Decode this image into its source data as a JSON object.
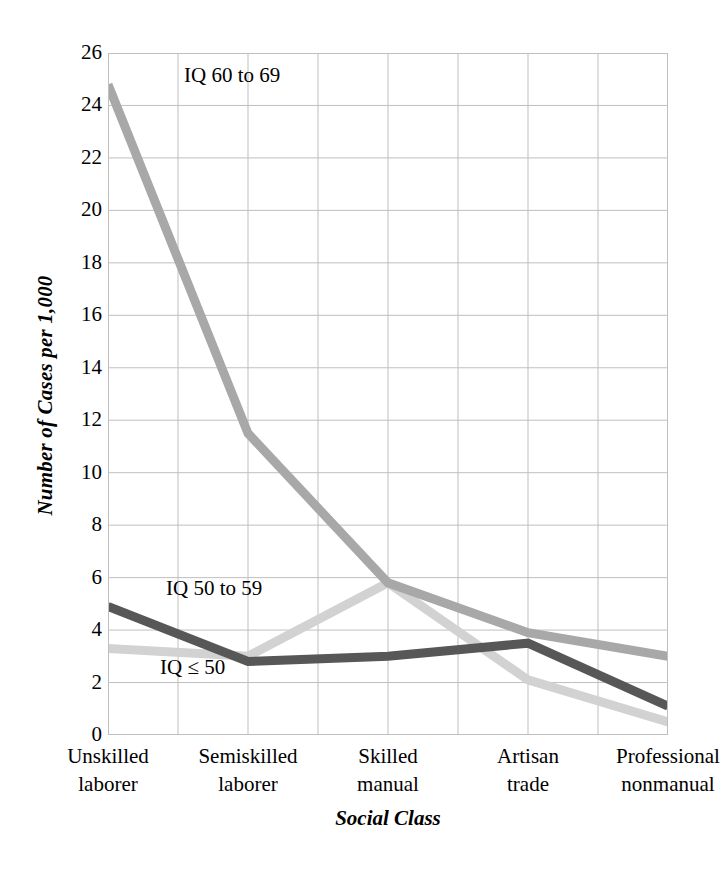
{
  "chart_data": {
    "type": "line",
    "title": "",
    "xlabel": "Social Class",
    "ylabel": "Number of Cases per 1,000",
    "categories": [
      "Unskilled laborer",
      "Semiskilled laborer",
      "Skilled manual",
      "Artisan trade",
      "Professional nonmanual"
    ],
    "category_lines": [
      [
        "Unskilled",
        "laborer"
      ],
      [
        "Semiskilled",
        "laborer"
      ],
      [
        "Skilled",
        "manual"
      ],
      [
        "Artisan",
        "trade"
      ],
      [
        "Professional",
        "nonmanual"
      ]
    ],
    "ylim": [
      0,
      26
    ],
    "yticks": [
      26,
      24,
      22,
      20,
      18,
      16,
      14,
      12,
      10,
      8,
      6,
      4,
      2,
      0
    ],
    "grid": true,
    "legend_position": "inline-annotations",
    "series": [
      {
        "name": "IQ 60 to 69",
        "color": "#a8a8a8",
        "values": [
          24.8,
          11.5,
          5.8,
          3.9,
          3.0
        ]
      },
      {
        "name": "IQ 50 to 59",
        "color": "#575757",
        "values": [
          4.9,
          2.8,
          3.0,
          3.5,
          1.1
        ]
      },
      {
        "name": "IQ ≤ 50",
        "color": "#d2d2d2",
        "values": [
          3.3,
          3.0,
          5.8,
          2.1,
          0.5
        ]
      }
    ]
  },
  "annotations": {
    "iq60": "IQ 60 to 69",
    "iq50": "IQ 50 to 59",
    "iqle50": "IQ ≤ 50"
  },
  "colors": {
    "grid": "#bfbfbf",
    "axis": "#7f7f7f",
    "background": "#ffffff",
    "series_iq60_69": "#a8a8a8",
    "series_iq50_59": "#575757",
    "series_iq_le_50": "#d2d2d2"
  }
}
